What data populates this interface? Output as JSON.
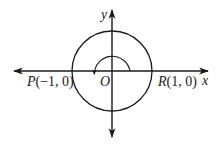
{
  "diagram": {
    "type": "unit-circle-rotation",
    "colors": {
      "stroke": "#1a1a1a",
      "background": "#ffffff"
    },
    "axes": {
      "x_label": "x",
      "y_label": "y",
      "origin_label": "O"
    },
    "points": [
      {
        "name": "P",
        "label_name": "P",
        "label_coords": "(−1, 0)",
        "x": -1,
        "y": 0
      },
      {
        "name": "R",
        "label_name": "R",
        "label_coords": "(1, 0)",
        "x": 1,
        "y": 0
      }
    ],
    "circle": {
      "center": "O",
      "radius": 1
    },
    "rotation_arc": {
      "from_deg": 0,
      "to_deg": 170,
      "direction": "counterclockwise"
    }
  }
}
